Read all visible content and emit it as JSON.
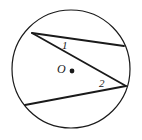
{
  "figure": {
    "background_color": "#ffffff",
    "stroke_color": "#1a1a1a",
    "labels": {
      "angle_1": "1",
      "angle_2": "2",
      "center": "O"
    },
    "circle": {
      "center_x": 71,
      "center_y": 69,
      "radius": 59,
      "stroke_width": 1.2
    },
    "center_dot": {
      "x": 72,
      "y": 71,
      "radius": 2.4
    },
    "points": {
      "A": {
        "x": 32,
        "y": 33,
        "name": "upper-left-vertex"
      },
      "B": {
        "x": 124,
        "y": 46,
        "name": "upper-right-endpoint"
      },
      "C": {
        "x": 126,
        "y": 86,
        "name": "right-vertex"
      },
      "D": {
        "x": 25,
        "y": 105,
        "name": "lower-left-endpoint"
      }
    },
    "chords": [
      {
        "name": "chord-A-B",
        "x1": 32,
        "y1": 33,
        "x2": 124,
        "y2": 46,
        "stroke_width": 1.8
      },
      {
        "name": "chord-A-C",
        "x1": 32,
        "y1": 33,
        "x2": 126,
        "y2": 86,
        "stroke_width": 1.8
      },
      {
        "name": "chord-C-D",
        "x1": 126,
        "y1": 86,
        "x2": 25,
        "y2": 105,
        "stroke_width": 1.8
      }
    ]
  }
}
